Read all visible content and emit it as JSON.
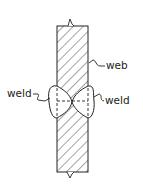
{
  "diagram": {
    "title": "",
    "labels": {
      "web": "web",
      "weld_left": "weld",
      "weld_right": "weld"
    },
    "colors": {
      "stroke": "#222222",
      "background": "#ffffff"
    }
  }
}
